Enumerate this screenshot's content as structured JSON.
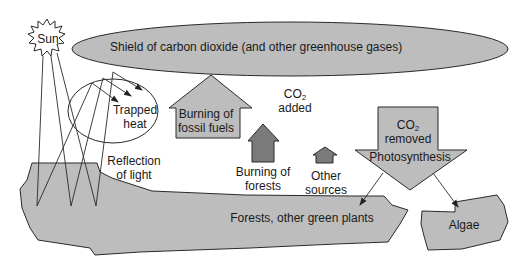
{
  "diagram": {
    "sun": {
      "label": "Sun"
    },
    "shield": {
      "label": "Shield of carbon dioxide (and other greenhouse gases)"
    },
    "trapped_heat": {
      "line1": "Trapped",
      "line2": "heat"
    },
    "reflection": {
      "line1": "Reflection",
      "line2": "of light"
    },
    "co2_added": {
      "co": "CO",
      "sub": "2",
      "line2": "added"
    },
    "sources": [
      {
        "id": "fossil-fuels",
        "line1": "Burning of",
        "line2": "fossil fuels"
      },
      {
        "id": "forests",
        "line1": "Burning of",
        "line2": "forests"
      },
      {
        "id": "other",
        "line1": "Other",
        "line2": "sources"
      }
    ],
    "co2_removed": {
      "co": "CO",
      "sub": "2",
      "line2": "removed",
      "process": "Photosynthesis"
    },
    "sinks": [
      {
        "id": "plants",
        "label": "Forests, other green plants"
      },
      {
        "id": "algae",
        "label": "Algae"
      }
    ],
    "colors": {
      "fill_light": "#bdbdbd",
      "fill_dark": "#7a7a7a",
      "stroke": "#2a2a2a",
      "background": "#ffffff"
    }
  }
}
